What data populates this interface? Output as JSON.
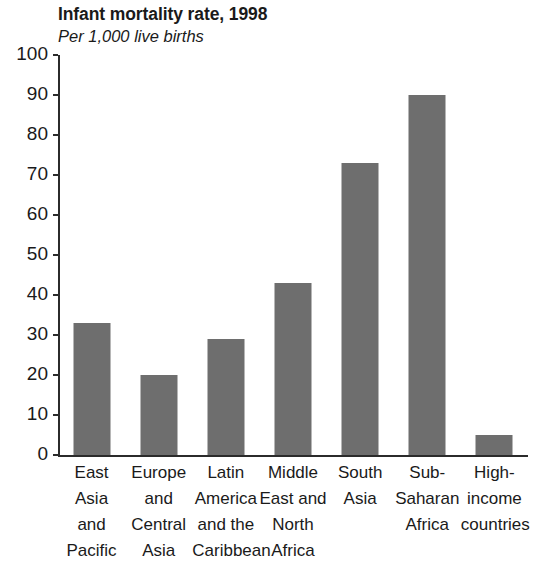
{
  "chart_data": {
    "type": "bar",
    "title": "Infant mortality rate, 1998",
    "subtitle": "Per 1,000 live births",
    "xlabel": "",
    "ylabel": "",
    "ylim": [
      0,
      100
    ],
    "yticks": [
      0,
      10,
      20,
      30,
      40,
      50,
      60,
      70,
      80,
      90,
      100
    ],
    "ytick_labels": [
      "0",
      "10",
      "20",
      "30",
      "40",
      "50",
      "60",
      "70",
      "80",
      "90",
      "100"
    ],
    "grid": false,
    "legend": false,
    "bar_color": "#6e6e6e",
    "axis_color": "#2b2b2b",
    "categories": [
      "East Asia and Pacific",
      "Europe and Central Asia",
      "Latin America and the Caribbean",
      "Middle East and North Africa",
      "South Asia",
      "Sub-Saharan Africa",
      "High-income countries"
    ],
    "category_lines": [
      [
        "East",
        "Asia",
        "and",
        "Pacific"
      ],
      [
        "Europe",
        "and",
        "Central",
        "Asia"
      ],
      [
        "Latin",
        "America",
        "and the",
        "Caribbean"
      ],
      [
        "Middle",
        "East and",
        "North",
        "Africa"
      ],
      [
        "South",
        "Asia"
      ],
      [
        "Sub-",
        "Saharan",
        "Africa"
      ],
      [
        "High-",
        "income",
        "countries"
      ]
    ],
    "values": [
      33,
      20,
      29,
      43,
      73,
      90,
      5
    ]
  }
}
